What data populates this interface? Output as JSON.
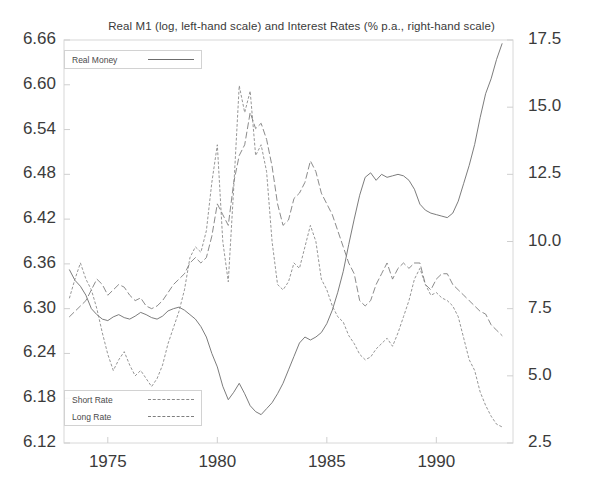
{
  "chart_data": {
    "type": "line",
    "title": "Real M1 (log, left-hand scale) and Interest Rates (% p.a., right-hand scale)",
    "xlabel": "",
    "ylabel": "",
    "grid": false,
    "legend_position": "inside-top-left and inside-bottom-left",
    "xlim": [
      1973.0,
      1993.5
    ],
    "x_ticks": [
      "1975",
      "1980",
      "1985",
      "1990"
    ],
    "x_tick_values": [
      1975,
      1980,
      1985,
      1990
    ],
    "left_axis": {
      "label": "Real M1 (log)",
      "ylim": [
        6.12,
        6.66
      ],
      "ticks": [
        "6.66",
        "6.60",
        "6.54",
        "6.48",
        "6.42",
        "6.36",
        "6.30",
        "6.24",
        "6.18",
        "6.12"
      ],
      "tick_values": [
        6.66,
        6.6,
        6.54,
        6.48,
        6.42,
        6.36,
        6.3,
        6.24,
        6.18,
        6.12
      ]
    },
    "right_axis": {
      "label": "Interest Rates (% p.a.)",
      "ylim": [
        2.5,
        17.5
      ],
      "ticks": [
        "17.5",
        "15.0",
        "12.5",
        "10.0",
        "7.5",
        "5.0",
        "2.5"
      ],
      "tick_values": [
        17.5,
        15.0,
        12.5,
        10.0,
        7.5,
        5.0,
        2.5
      ]
    },
    "x": [
      1973.25,
      1973.5,
      1973.75,
      1974.0,
      1974.25,
      1974.5,
      1974.75,
      1975.0,
      1975.25,
      1975.5,
      1975.75,
      1976.0,
      1976.25,
      1976.5,
      1976.75,
      1977.0,
      1977.25,
      1977.5,
      1977.75,
      1978.0,
      1978.25,
      1978.5,
      1978.75,
      1979.0,
      1979.25,
      1979.5,
      1979.75,
      1980.0,
      1980.25,
      1980.5,
      1980.75,
      1981.0,
      1981.25,
      1981.5,
      1981.75,
      1982.0,
      1982.25,
      1982.5,
      1982.75,
      1983.0,
      1983.25,
      1983.5,
      1983.75,
      1984.0,
      1984.25,
      1984.5,
      1984.75,
      1985.0,
      1985.25,
      1985.5,
      1985.75,
      1986.0,
      1986.25,
      1986.5,
      1986.75,
      1987.0,
      1987.25,
      1987.5,
      1987.75,
      1988.0,
      1988.25,
      1988.5,
      1988.75,
      1989.0,
      1989.25,
      1989.5,
      1989.75,
      1990.0,
      1990.25,
      1990.5,
      1990.75,
      1991.0,
      1991.25,
      1991.5,
      1991.75,
      1992.0,
      1992.25,
      1992.5,
      1992.75,
      1993.0
    ],
    "series": [
      {
        "name": "Real Money",
        "axis": "left",
        "style": "solid",
        "color": "#6d6d6d",
        "values": [
          6.352,
          6.338,
          6.33,
          6.318,
          6.3,
          6.292,
          6.286,
          6.284,
          6.289,
          6.292,
          6.288,
          6.286,
          6.29,
          6.295,
          6.292,
          6.288,
          6.286,
          6.29,
          6.297,
          6.3,
          6.302,
          6.298,
          6.292,
          6.286,
          6.276,
          6.262,
          6.24,
          6.222,
          6.196,
          6.178,
          6.188,
          6.2,
          6.186,
          6.17,
          6.162,
          6.158,
          6.166,
          6.174,
          6.186,
          6.2,
          6.218,
          6.236,
          6.254,
          6.262,
          6.258,
          6.262,
          6.268,
          6.28,
          6.298,
          6.322,
          6.35,
          6.386,
          6.42,
          6.452,
          6.476,
          6.482,
          6.472,
          6.48,
          6.476,
          6.478,
          6.48,
          6.478,
          6.472,
          6.46,
          6.44,
          6.432,
          6.428,
          6.426,
          6.424,
          6.422,
          6.428,
          6.444,
          6.468,
          6.492,
          6.52,
          6.556,
          6.588,
          6.608,
          6.634,
          6.655
        ]
      },
      {
        "name": "Short Rate",
        "axis": "right",
        "style": "dashed-fine",
        "color": "#8a8a8a",
        "values": [
          7.9,
          8.6,
          9.2,
          8.6,
          8.2,
          7.5,
          6.6,
          5.8,
          5.2,
          5.6,
          5.9,
          5.4,
          5.0,
          5.2,
          4.9,
          4.6,
          4.9,
          5.4,
          6.2,
          6.8,
          7.4,
          8.2,
          9.4,
          9.8,
          9.6,
          10.4,
          12.2,
          13.6,
          10.0,
          8.5,
          12.0,
          15.8,
          14.8,
          15.6,
          13.2,
          13.6,
          12.6,
          10.0,
          8.4,
          8.2,
          8.5,
          9.2,
          9.0,
          9.8,
          10.6,
          10.0,
          8.6,
          8.2,
          7.6,
          7.2,
          7.0,
          6.5,
          6.2,
          5.8,
          5.6,
          5.7,
          6.0,
          6.2,
          6.4,
          6.1,
          6.6,
          7.2,
          7.8,
          8.6,
          9.0,
          8.4,
          8.0,
          8.1,
          7.9,
          7.8,
          7.6,
          7.2,
          6.4,
          5.6,
          5.2,
          4.4,
          3.9,
          3.5,
          3.2,
          3.1
        ]
      },
      {
        "name": "Long Rate",
        "axis": "right",
        "style": "dashed-long",
        "color": "#7e7e7e",
        "values": [
          7.2,
          7.4,
          7.6,
          7.8,
          8.2,
          8.6,
          8.4,
          8.0,
          8.2,
          8.4,
          8.3,
          8.0,
          7.8,
          7.9,
          7.6,
          7.5,
          7.6,
          7.8,
          8.1,
          8.4,
          8.6,
          8.8,
          9.2,
          9.4,
          9.2,
          9.4,
          10.2,
          11.4,
          11.0,
          10.6,
          12.2,
          13.2,
          13.6,
          14.8,
          14.2,
          14.4,
          13.8,
          12.8,
          11.4,
          10.6,
          10.8,
          11.6,
          11.8,
          12.2,
          13.0,
          12.6,
          11.8,
          11.4,
          11.0,
          10.4,
          9.8,
          9.2,
          8.8,
          7.8,
          7.6,
          7.8,
          8.4,
          8.8,
          9.2,
          8.6,
          9.0,
          9.2,
          9.0,
          9.2,
          9.2,
          8.4,
          8.2,
          8.6,
          8.8,
          8.8,
          8.4,
          8.2,
          8.0,
          7.8,
          7.6,
          7.4,
          7.3,
          6.9,
          6.7,
          6.5
        ]
      }
    ]
  },
  "legend_top": {
    "items": [
      {
        "label": "Real Money",
        "style": "solid"
      }
    ]
  },
  "legend_bottom": {
    "items": [
      {
        "label": "Short Rate",
        "style": "short-dash"
      },
      {
        "label": "Long Rate",
        "style": "long-dash"
      }
    ]
  }
}
